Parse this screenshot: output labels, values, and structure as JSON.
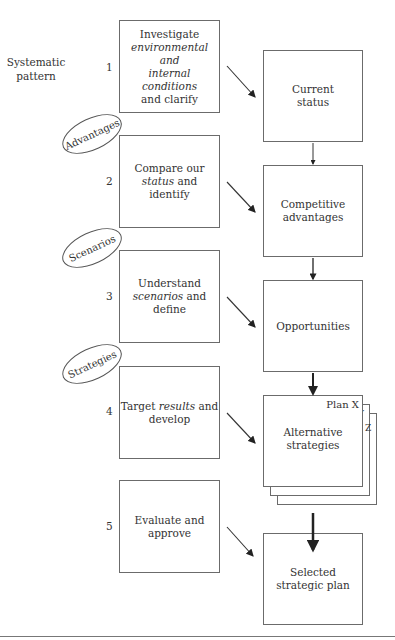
{
  "side_label": {
    "line1": "Systematic",
    "line2": "pattern"
  },
  "steps": [
    {
      "num": "1",
      "parts": [
        "Investigate",
        "environmental and",
        "internal conditions",
        "and clarify"
      ]
    },
    {
      "num": "2",
      "parts": [
        "Compare our",
        "status",
        " and identify"
      ]
    },
    {
      "num": "3",
      "parts": [
        "Understand",
        "scenarios",
        " and define"
      ]
    },
    {
      "num": "4",
      "parts": [
        "Target ",
        "results",
        " and",
        "develop"
      ]
    },
    {
      "num": "5",
      "parts": [
        "Evaluate and",
        "approve"
      ]
    }
  ],
  "ellipses": [
    "Advantages",
    "Scenarios",
    "Strategies"
  ],
  "outcomes": [
    {
      "line1": "Current",
      "line2": "status"
    },
    {
      "line1": "Competitive",
      "line2": "advantages"
    },
    {
      "line1": "Opportunities",
      "line2": ""
    },
    {
      "line1": "Alternative",
      "line2": "strategies"
    },
    {
      "line1": "Selected",
      "line2": "strategic plan"
    }
  ],
  "plan_tags": {
    "x": "Plan X",
    "y": "Y",
    "z": "Z"
  }
}
